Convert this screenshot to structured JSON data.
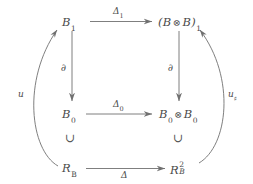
{
  "diagram": {
    "type": "commutative-diagram",
    "background_color": "#ffffff",
    "line_color": "#707070",
    "text_color": "#4a4a4a",
    "nodes": {
      "top_left": {
        "base": "B",
        "sub": "1",
        "label": "B_1"
      },
      "top_right": {
        "open": "(",
        "left": "B",
        "tensor": "⊗",
        "right": "B",
        "close": ")",
        "sub": "1",
        "label": "(B ⊗ B)_1"
      },
      "mid_left": {
        "base": "B",
        "sub": "0",
        "label": "B_0"
      },
      "mid_right": {
        "left": "B",
        "left_sub": "0",
        "tensor": "⊗",
        "right": "B",
        "right_sub": "0",
        "label": "B_0 ⊗ B_0"
      },
      "bottom_left": {
        "base": "R",
        "sub": "B",
        "label": "R_B"
      },
      "bottom_right": {
        "base": "R",
        "sub": "B",
        "sup": "2",
        "label": "R_B^2"
      }
    },
    "arrows": {
      "top_horizontal": {
        "label": "Δ",
        "sub": "1",
        "direction": "right"
      },
      "middle_horizontal": {
        "label": "Δ",
        "sub": "0",
        "direction": "right"
      },
      "bottom_horizontal": {
        "label": "Δ",
        "sub": "",
        "direction": "right"
      },
      "left_vertical": {
        "label": "∂",
        "direction": "down"
      },
      "right_vertical": {
        "label": "∂",
        "direction": "down"
      },
      "left_curve": {
        "label": "u",
        "sub": "",
        "direction": "up"
      },
      "right_curve": {
        "label": "u",
        "sub": "♯",
        "direction": "up"
      }
    },
    "inclusions": {
      "left": {
        "symbol": "∪"
      },
      "right": {
        "symbol": "∪"
      }
    }
  }
}
